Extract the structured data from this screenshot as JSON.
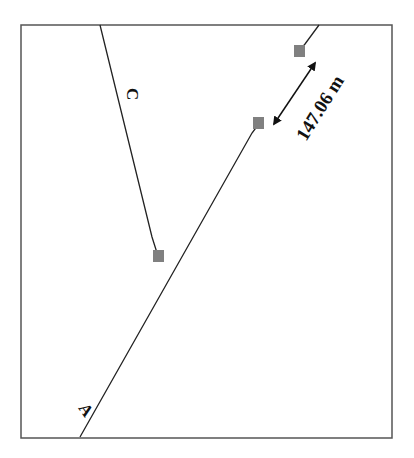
{
  "diagram": {
    "frame": {
      "x": 21,
      "y": 25,
      "width": 371,
      "height": 413,
      "stroke": "#555555"
    },
    "lines": [
      {
        "id": "A",
        "label": "A",
        "segments": [
          [
            [
              80,
              437
            ],
            [
              258,
              125
            ]
          ],
          [
            [
              300,
              50
            ],
            [
              319,
              25
            ]
          ]
        ]
      },
      {
        "id": "C",
        "label": "C",
        "segments": [
          [
            [
              100,
              25
            ],
            [
              158,
              256
            ]
          ]
        ]
      }
    ],
    "markers": [
      {
        "id": "a-lower-end",
        "x": 253,
        "y": 117,
        "size": 11,
        "color": "#808080"
      },
      {
        "id": "a-upper-end",
        "x": 294,
        "y": 45,
        "size": 11,
        "color": "#808080"
      },
      {
        "id": "c-end",
        "x": 153,
        "y": 250,
        "size": 11,
        "color": "#808080"
      }
    ],
    "gap_measure": {
      "label": "147.06 m",
      "from": [
        273,
        124
      ],
      "to": [
        316,
        62
      ]
    },
    "labels": {
      "line_a": "A",
      "line_c": "C"
    }
  }
}
